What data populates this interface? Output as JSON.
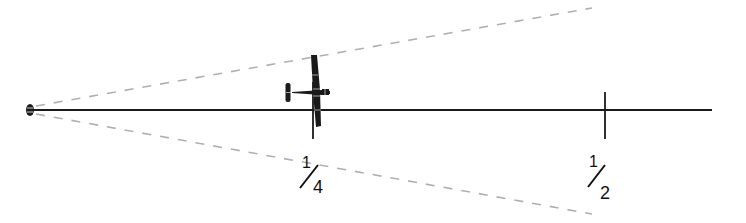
{
  "diagram": {
    "colors": {
      "line": "#1a1a1a",
      "dashed": "#b0b0b0",
      "background": "#ffffff"
    },
    "markers": [
      {
        "position": "1/4",
        "numerator": "1",
        "denominator": "4"
      },
      {
        "position": "1/2",
        "numerator": "1",
        "denominator": "2"
      }
    ],
    "objects": {
      "observer": "eye-icon",
      "aircraft": "airplane-icon"
    }
  }
}
